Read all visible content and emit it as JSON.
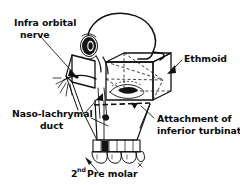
{
  "figure": {
    "style": {
      "background": "#ffffff",
      "ink": "#111111",
      "text_color": "#0a0a0a"
    },
    "labels": [
      {
        "id": "infra-orbital-nerve",
        "lines": [
          "Infra orbital",
          "nerve"
        ],
        "line1": "Infra orbital",
        "line2": "nerve",
        "position": "top-left",
        "text_x": 14,
        "text_y": 26,
        "align": "start",
        "leader": "from label down-right to infraorbital foramen on maxilla",
        "arrow": true
      },
      {
        "id": "ethmoid",
        "lines": [
          "Ethmoid"
        ],
        "line1": "Ethmoid",
        "position": "right",
        "text_x": 184,
        "text_y": 62,
        "align": "start",
        "leader": "short arrow pointing left-down into the 3D ethmoid box",
        "arrow": true
      },
      {
        "id": "naso-lachrymal-duct",
        "lines": [
          "Naso-lachrymal",
          "duct"
        ],
        "line1": "Naso-lachrymal",
        "line2": "duct",
        "position": "left-lower",
        "text_x": 14,
        "text_y": 117,
        "align": "start",
        "leader": "two lines up-right to the nasolachrymal duct region",
        "arrow": true
      },
      {
        "id": "attachment-of-inferior-turbinate",
        "lines": [
          "Attachment of",
          "inferior turbinate"
        ],
        "line1": "Attachment of",
        "line2": "inferior turbinate",
        "position": "right-lower",
        "text_x": 157,
        "text_y": 122,
        "align": "start",
        "leader": "up-left to the dashed turbinate attachment line",
        "arrow": true
      },
      {
        "id": "second-pre-molar",
        "lines": [
          "2nd Pre molar"
        ],
        "numeral": "2",
        "superscript": "nd",
        "line1": "Pre molar",
        "position": "bottom",
        "text_x": 71,
        "text_y": 177,
        "align": "start",
        "leader": "up-right to the second premolar tooth",
        "arrow": true
      }
    ],
    "structures": [
      {
        "id": "cranium-outline",
        "name": "cranium"
      },
      {
        "id": "orbit",
        "name": "orbital cavity with dark rim"
      },
      {
        "id": "ethmoid-box",
        "name": "3D box representing ethmoid labyrinth"
      },
      {
        "id": "zygomatic-plate",
        "name": "zygomatic / lateral orbital wall plate"
      },
      {
        "id": "maxilla",
        "name": "maxilla with alveolar process"
      },
      {
        "id": "dental-arch",
        "name": "upper teeth row"
      },
      {
        "id": "infraorbital-nerve-branches",
        "name": "branching nerve filaments"
      },
      {
        "id": "turbinate-dashed-line",
        "name": "dashed inferior turbinate attachment line"
      },
      {
        "id": "nasal-aperture",
        "name": "dark nasal aperture"
      }
    ]
  }
}
